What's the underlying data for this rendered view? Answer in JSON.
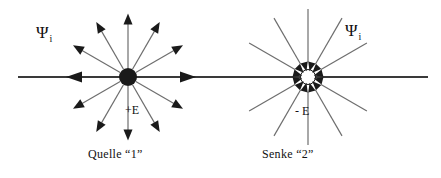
{
  "figure": {
    "width": 441,
    "height": 178,
    "background": "#ffffff",
    "stroke_dark": "#1a1a1a",
    "stroke_ray": "#6e6e6e",
    "axis_color": "#3a3a3a"
  },
  "axis": {
    "name": "horizontal-axis",
    "x_start": 18,
    "x_end": 428,
    "y": 77,
    "arrow_left_x": 74,
    "arrow_right_x": 188
  },
  "source": {
    "caption": "Quelle “1”",
    "field_label": "+E",
    "psi_symbol": "Ψ",
    "psi_subscript": "i",
    "center_x": 128,
    "center_y": 77,
    "marker": "filled-disc",
    "marker_radius": 9,
    "ray_count": 12,
    "ray_length": 62,
    "ray_direction": "outward",
    "arrowheads_at": "tips"
  },
  "sink": {
    "caption": "Senke “2”",
    "field_label": "- E",
    "psi_symbol": "Ψ",
    "psi_subscript": "i",
    "center_x": 308,
    "center_y": 77,
    "marker": "hollow-ring-with-inward-arrowheads",
    "marker_radius": 13,
    "ray_count": 12,
    "ray_length": 68,
    "ray_direction": "inward",
    "arrowheads_at": "center"
  },
  "angles_deg": [
    0,
    30,
    60,
    90,
    120,
    150,
    180,
    210,
    240,
    270,
    300,
    330
  ]
}
